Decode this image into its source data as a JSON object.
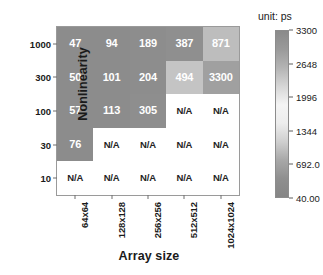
{
  "chart_data": {
    "type": "heatmap",
    "title": "",
    "xlabel": "Array size",
    "ylabel": "Nonlinearity",
    "unit_label": "unit: ps",
    "categories_x": [
      "64x64",
      "128x128",
      "256x256",
      "512x512",
      "1024x1024"
    ],
    "categories_y": [
      "1000",
      "300",
      "100",
      "30",
      "10"
    ],
    "na_text": "N/A",
    "grid": false,
    "legend_position": "right",
    "colorbar": {
      "ticks": [
        "3300",
        "2648",
        "1996",
        "1344",
        "692.0",
        "40.00"
      ],
      "tick_values": [
        3300,
        2648,
        1996,
        1344,
        692.0,
        40.0
      ],
      "min": 40.0,
      "max": 3300,
      "stops": [
        "#8a8a8a",
        "#9a9a9a",
        "#b4b4b4",
        "#d6d6d6",
        "#f4f4f4",
        "#ededed",
        "#cfcfcf",
        "#a8a8a8",
        "#8f8f8f",
        "#858585"
      ]
    },
    "rows": [
      {
        "y": "1000",
        "cells": [
          {
            "label": "47",
            "value": 47,
            "na": false,
            "color": "#8c8c8c"
          },
          {
            "label": "94",
            "value": 94,
            "na": false,
            "color": "#8c8c8c"
          },
          {
            "label": "189",
            "value": 189,
            "na": false,
            "color": "#8d8d8d"
          },
          {
            "label": "387",
            "value": 387,
            "na": false,
            "color": "#8f8f8f"
          },
          {
            "label": "871",
            "value": 871,
            "na": false,
            "color": "#bdbdbd"
          }
        ]
      },
      {
        "y": "300",
        "cells": [
          {
            "label": "50",
            "value": 50,
            "na": false,
            "color": "#8c8c8c"
          },
          {
            "label": "101",
            "value": 101,
            "na": false,
            "color": "#8c8c8c"
          },
          {
            "label": "204",
            "value": 204,
            "na": false,
            "color": "#8d8d8d"
          },
          {
            "label": "494",
            "value": 494,
            "na": false,
            "color": "#c4c4c4"
          },
          {
            "label": "3300",
            "value": 3300,
            "na": false,
            "color": "#a0a0a0"
          }
        ]
      },
      {
        "y": "100",
        "cells": [
          {
            "label": "57",
            "value": 57,
            "na": false,
            "color": "#8c8c8c"
          },
          {
            "label": "113",
            "value": 113,
            "na": false,
            "color": "#8c8c8c"
          },
          {
            "label": "305",
            "value": 305,
            "na": false,
            "color": "#8e8e8e"
          },
          {
            "label": "N/A",
            "value": null,
            "na": true,
            "color": "#ffffff"
          },
          {
            "label": "N/A",
            "value": null,
            "na": true,
            "color": "#ffffff"
          }
        ]
      },
      {
        "y": "30",
        "cells": [
          {
            "label": "76",
            "value": 76,
            "na": false,
            "color": "#8c8c8c"
          },
          {
            "label": "N/A",
            "value": null,
            "na": true,
            "color": "#ffffff"
          },
          {
            "label": "N/A",
            "value": null,
            "na": true,
            "color": "#ffffff"
          },
          {
            "label": "N/A",
            "value": null,
            "na": true,
            "color": "#ffffff"
          },
          {
            "label": "N/A",
            "value": null,
            "na": true,
            "color": "#ffffff"
          }
        ]
      },
      {
        "y": "10",
        "cells": [
          {
            "label": "N/A",
            "value": null,
            "na": true,
            "color": "#ffffff"
          },
          {
            "label": "N/A",
            "value": null,
            "na": true,
            "color": "#ffffff"
          },
          {
            "label": "N/A",
            "value": null,
            "na": true,
            "color": "#ffffff"
          },
          {
            "label": "N/A",
            "value": null,
            "na": true,
            "color": "#ffffff"
          },
          {
            "label": "N/A",
            "value": null,
            "na": true,
            "color": "#ffffff"
          }
        ]
      }
    ]
  }
}
